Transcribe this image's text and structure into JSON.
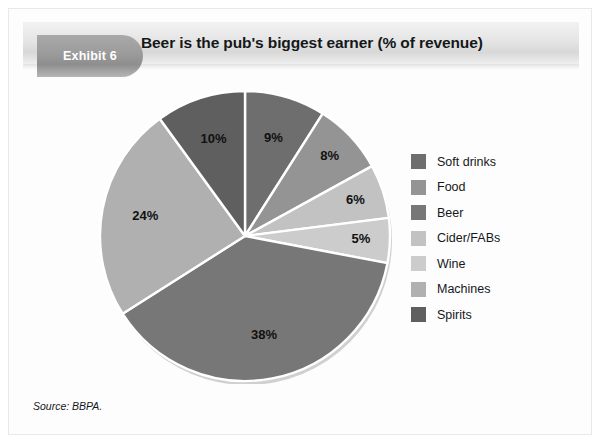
{
  "exhibit": {
    "badge_label": "Exhibit 6",
    "title": "Beer is the pub's biggest earner (% of revenue)"
  },
  "source": {
    "text": "Source: BBPA."
  },
  "legend": {
    "items": [
      {
        "label": "Soft drinks",
        "color": "#6e6e6e"
      },
      {
        "label": "Food",
        "color": "#949494"
      },
      {
        "label": "Beer",
        "color": "#777777"
      },
      {
        "label": "Cider/FABs",
        "color": "#c2c2c2"
      },
      {
        "label": "Wine",
        "color": "#cccccc"
      },
      {
        "label": "Machines",
        "color": "#b0b0b0"
      },
      {
        "label": "Spirits",
        "color": "#5f5f5f"
      }
    ]
  },
  "chart_data": {
    "type": "pie",
    "title": "Beer is the pub's biggest earner (% of revenue)",
    "unit": "%",
    "legend_position": "right",
    "start_angle_deg": 0,
    "direction": "clockwise",
    "labels": [
      "Soft drinks",
      "Food",
      "Cider/FABs",
      "Wine",
      "Beer",
      "Machines",
      "Spirits"
    ],
    "values": [
      9,
      8,
      6,
      5,
      38,
      24,
      10
    ],
    "value_labels": [
      "9%",
      "8%",
      "6%",
      "5%",
      "38%",
      "24%",
      "10%"
    ],
    "colors": [
      "#6e6e6e",
      "#949494",
      "#c2c2c2",
      "#cccccc",
      "#777777",
      "#b0b0b0",
      "#5f5f5f"
    ],
    "total": 100,
    "slices": [
      {
        "name": "Soft drinks",
        "value": 9,
        "label": "9%",
        "color": "#6e6e6e"
      },
      {
        "name": "Food",
        "value": 8,
        "label": "8%",
        "color": "#949494"
      },
      {
        "name": "Cider/FABs",
        "value": 6,
        "label": "6%",
        "color": "#c2c2c2"
      },
      {
        "name": "Wine",
        "value": 5,
        "label": "5%",
        "color": "#cccccc"
      },
      {
        "name": "Beer",
        "value": 38,
        "label": "38%",
        "color": "#777777"
      },
      {
        "name": "Machines",
        "value": 24,
        "label": "24%",
        "color": "#b0b0b0"
      },
      {
        "name": "Spirits",
        "value": 10,
        "label": "10%",
        "color": "#5f5f5f"
      }
    ]
  }
}
